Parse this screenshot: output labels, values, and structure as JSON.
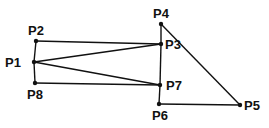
{
  "diagram": {
    "title": "",
    "points": [
      {
        "id": "P1",
        "label": "P1",
        "x": 34,
        "y": 62,
        "lx": 5,
        "ly": 67
      },
      {
        "id": "P2",
        "label": "P2",
        "x": 36,
        "y": 41,
        "lx": 28,
        "ly": 35
      },
      {
        "id": "P3",
        "label": "P3",
        "x": 161,
        "y": 44,
        "lx": 165,
        "ly": 49
      },
      {
        "id": "P4",
        "label": "P4",
        "x": 161,
        "y": 24,
        "lx": 153,
        "ly": 18
      },
      {
        "id": "P5",
        "label": "P5",
        "x": 240,
        "y": 105,
        "lx": 244,
        "ly": 110
      },
      {
        "id": "P6",
        "label": "P6",
        "x": 159,
        "y": 104,
        "lx": 152,
        "ly": 120
      },
      {
        "id": "P7",
        "label": "P7",
        "x": 160,
        "y": 85,
        "lx": 166,
        "ly": 90
      },
      {
        "id": "P8",
        "label": "P8",
        "x": 35,
        "y": 83,
        "lx": 27,
        "ly": 99
      }
    ],
    "edges": [
      [
        "P2",
        "P1"
      ],
      [
        "P1",
        "P8"
      ],
      [
        "P2",
        "P3"
      ],
      [
        "P1",
        "P3"
      ],
      [
        "P1",
        "P7"
      ],
      [
        "P8",
        "P7"
      ],
      [
        "P4",
        "P3"
      ],
      [
        "P3",
        "P7"
      ],
      [
        "P7",
        "P6"
      ],
      [
        "P4",
        "P5"
      ],
      [
        "P6",
        "P5"
      ]
    ],
    "colors": {
      "stroke": "#111111",
      "background": "#ffffff"
    }
  }
}
